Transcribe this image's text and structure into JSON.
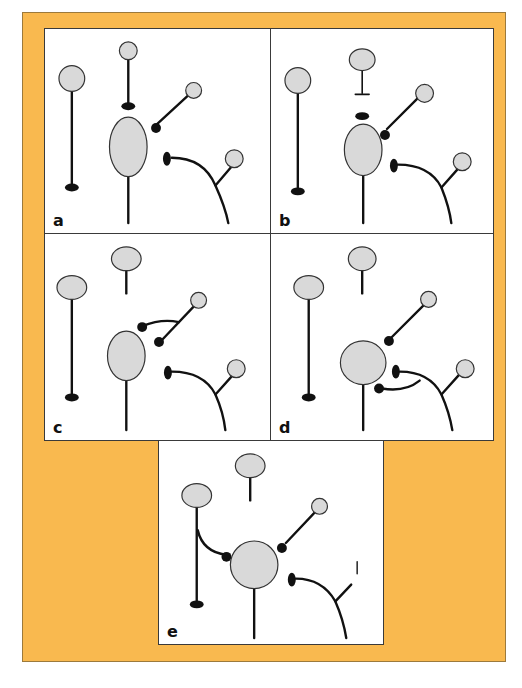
{
  "figure": {
    "colors": {
      "frame_background": "#f9b94f",
      "panel_background": "#ffffff",
      "cell_body_fill": "#d9d9d9",
      "line": "#111111"
    },
    "panels": [
      {
        "id": "a",
        "label": "a",
        "description": "Intact circuit: target cell with three presynaptic terminals (one from above, one from upper right, one curved from lower right)"
      },
      {
        "id": "b",
        "label": "b",
        "description": "Top input axon severed; its terminal detached near target cell"
      },
      {
        "id": "c",
        "label": "c",
        "description": "Degenerated top terminal removed; collateral sprout from upper-right axon forms new terminal"
      },
      {
        "id": "d",
        "label": "d",
        "description": "Target cell enlarged; sprout from curved lower-right axon forms new terminal below"
      },
      {
        "id": "e",
        "label": "e",
        "description": "Left long axon sprouts collateral onto target cell; lower-right input cell body lost"
      }
    ]
  }
}
